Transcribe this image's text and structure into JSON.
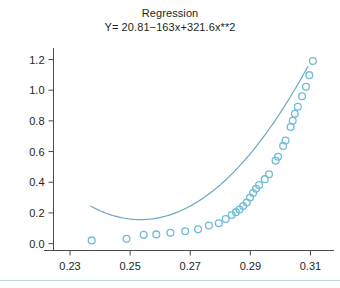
{
  "chart_data": {
    "type": "scatter",
    "title": "Regression",
    "subtitle": "Y= 20.81−163x+321.6x**2",
    "xlabel": "",
    "ylabel": "",
    "xlim": [
      0.2245,
      0.3165
    ],
    "ylim": [
      -0.045,
      1.275
    ],
    "xticks": [
      0.23,
      0.25,
      0.27,
      0.29,
      0.31
    ],
    "xtick_labels": [
      "0.23",
      "0.25",
      "0.27",
      "0.29",
      "0.31"
    ],
    "yticks": [
      0.0,
      0.2,
      0.4,
      0.6,
      0.8,
      1.0,
      1.2
    ],
    "ytick_labels": [
      "0.0",
      "0.2",
      "0.4",
      "0.6",
      "0.8",
      "1.0",
      "1.2"
    ],
    "grid": false,
    "legend": "none",
    "marker": "open-circle",
    "marker_color": "#6fbcd8",
    "curve_color": "#6aa8c4",
    "axis_color": "#4b4b4b",
    "equation": {
      "intercept": 20.81,
      "linear": -163,
      "quadratic": 321.6
    },
    "points": [
      {
        "x": 0.2372,
        "y": 0.021
      },
      {
        "x": 0.2488,
        "y": 0.032
      },
      {
        "x": 0.2545,
        "y": 0.057
      },
      {
        "x": 0.2587,
        "y": 0.06
      },
      {
        "x": 0.2634,
        "y": 0.07
      },
      {
        "x": 0.2683,
        "y": 0.08
      },
      {
        "x": 0.2726,
        "y": 0.093
      },
      {
        "x": 0.2762,
        "y": 0.118
      },
      {
        "x": 0.2795,
        "y": 0.133
      },
      {
        "x": 0.2818,
        "y": 0.16
      },
      {
        "x": 0.2838,
        "y": 0.186
      },
      {
        "x": 0.2852,
        "y": 0.205
      },
      {
        "x": 0.2864,
        "y": 0.222
      },
      {
        "x": 0.2876,
        "y": 0.245
      },
      {
        "x": 0.2888,
        "y": 0.268
      },
      {
        "x": 0.2899,
        "y": 0.3
      },
      {
        "x": 0.2909,
        "y": 0.33
      },
      {
        "x": 0.2919,
        "y": 0.358
      },
      {
        "x": 0.2929,
        "y": 0.382
      },
      {
        "x": 0.2948,
        "y": 0.42
      },
      {
        "x": 0.2962,
        "y": 0.452
      },
      {
        "x": 0.2984,
        "y": 0.54
      },
      {
        "x": 0.2992,
        "y": 0.566
      },
      {
        "x": 0.3009,
        "y": 0.637
      },
      {
        "x": 0.3017,
        "y": 0.672
      },
      {
        "x": 0.3034,
        "y": 0.76
      },
      {
        "x": 0.3041,
        "y": 0.8
      },
      {
        "x": 0.3048,
        "y": 0.846
      },
      {
        "x": 0.3058,
        "y": 0.892
      },
      {
        "x": 0.3072,
        "y": 0.96
      },
      {
        "x": 0.3085,
        "y": 1.022
      },
      {
        "x": 0.3096,
        "y": 1.098
      },
      {
        "x": 0.3108,
        "y": 1.19
      }
    ],
    "curve_domain": [
      0.2368,
      0.3092
    ]
  }
}
